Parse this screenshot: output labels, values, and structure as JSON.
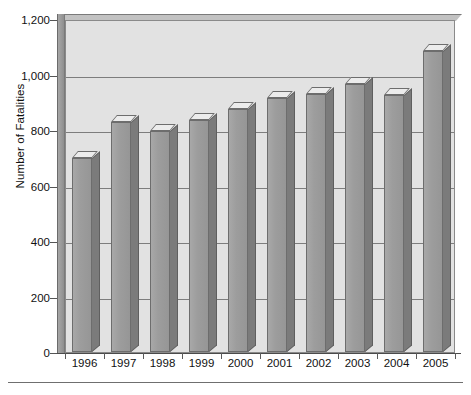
{
  "chart_data": {
    "type": "bar",
    "title": "",
    "xlabel": "",
    "ylabel": "Number of Fatalities",
    "categories": [
      "1996",
      "1997",
      "1998",
      "1999",
      "2000",
      "2001",
      "2002",
      "2003",
      "2004",
      "2005"
    ],
    "values": [
      700,
      830,
      795,
      835,
      875,
      915,
      930,
      965,
      925,
      1085
    ],
    "ylim": [
      0,
      1200
    ],
    "y_ticks": [
      0,
      200,
      400,
      600,
      800,
      1000,
      1200
    ],
    "y_tick_labels": [
      "0",
      "200",
      "400",
      "600",
      "800",
      "1,000",
      "1,200"
    ],
    "grid": true,
    "legend": "none",
    "style": "3d-column",
    "colors": {
      "bar_face": "#9d9d9d",
      "bar_side": "#7b7b7b",
      "bar_top": "#ececec",
      "plot_background": "#e2e2e2",
      "gridline": "#7d7d7d",
      "axis": "#4a4a4a",
      "text": "#111111"
    }
  }
}
